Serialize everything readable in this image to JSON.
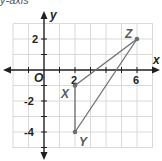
{
  "top_fragment": "y-axis",
  "graph": {
    "x_axis_label": "x",
    "y_axis_label": "y",
    "origin_label": "O",
    "x_tick_labels": [
      "2",
      "6"
    ],
    "y_tick_labels": [
      "2",
      "-2",
      "-4"
    ],
    "x_range": [
      -2,
      7
    ],
    "y_range": [
      -5,
      3
    ],
    "grid_color": "#d9d9d9",
    "line_color": "#6d6e71",
    "points": [
      {
        "name": "X",
        "x": 2,
        "y": -1
      },
      {
        "name": "Y",
        "x": 2,
        "y": -4
      },
      {
        "name": "Z",
        "x": 6,
        "y": 2
      }
    ],
    "segments": [
      [
        "X",
        "Y"
      ],
      [
        "Y",
        "Z"
      ],
      [
        "Z",
        "X"
      ]
    ]
  }
}
